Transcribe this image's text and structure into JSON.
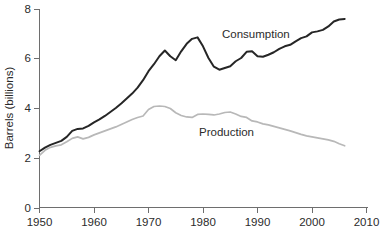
{
  "chart_data": {
    "type": "line",
    "title": "",
    "xlabel": "",
    "ylabel": "Barrels (billions)",
    "xlim": [
      1950,
      2010
    ],
    "ylim": [
      0,
      8
    ],
    "xticks": [
      1950,
      1960,
      1970,
      1980,
      1990,
      2000,
      2010
    ],
    "yticks": [
      0,
      2,
      4,
      6,
      8
    ],
    "grid": false,
    "legend_position": "inline-annotations",
    "annotations": [
      {
        "text": "Consumption",
        "x": 1983,
        "y": 7.05
      },
      {
        "text": "Production",
        "x": 1978,
        "y": 3.1
      }
    ],
    "x": [
      1950,
      1951,
      1952,
      1953,
      1954,
      1955,
      1956,
      1957,
      1958,
      1959,
      1960,
      1961,
      1962,
      1963,
      1964,
      1965,
      1966,
      1967,
      1968,
      1969,
      1970,
      1971,
      1972,
      1973,
      1974,
      1975,
      1976,
      1977,
      1978,
      1979,
      1980,
      1981,
      1982,
      1983,
      1984,
      1985,
      1986,
      1987,
      1988,
      1989,
      1990,
      1991,
      1992,
      1993,
      1994,
      1995,
      1996,
      1997,
      1998,
      1999,
      2000,
      2001,
      2002,
      2003,
      2004,
      2005,
      2006
    ],
    "series": [
      {
        "name": "Consumption",
        "color": "#262626",
        "values": [
          2.3,
          2.45,
          2.56,
          2.64,
          2.72,
          2.88,
          3.12,
          3.2,
          3.22,
          3.32,
          3.46,
          3.58,
          3.72,
          3.88,
          4.04,
          4.22,
          4.42,
          4.62,
          4.86,
          5.16,
          5.52,
          5.8,
          6.12,
          6.35,
          6.12,
          5.96,
          6.32,
          6.62,
          6.82,
          6.88,
          6.52,
          6.05,
          5.7,
          5.58,
          5.65,
          5.72,
          5.92,
          6.05,
          6.3,
          6.32,
          6.12,
          6.1,
          6.18,
          6.28,
          6.42,
          6.52,
          6.58,
          6.72,
          6.85,
          6.92,
          7.08,
          7.12,
          7.18,
          7.32,
          7.52,
          7.6,
          7.62
        ]
      },
      {
        "name": "Production",
        "color": "#b8b8b8",
        "values": [
          2.14,
          2.34,
          2.46,
          2.52,
          2.56,
          2.68,
          2.82,
          2.88,
          2.8,
          2.86,
          2.96,
          3.04,
          3.12,
          3.2,
          3.28,
          3.38,
          3.48,
          3.58,
          3.66,
          3.72,
          3.98,
          4.1,
          4.12,
          4.1,
          4.02,
          3.85,
          3.74,
          3.68,
          3.66,
          3.78,
          3.8,
          3.78,
          3.76,
          3.8,
          3.86,
          3.88,
          3.8,
          3.7,
          3.66,
          3.52,
          3.48,
          3.4,
          3.36,
          3.3,
          3.24,
          3.18,
          3.12,
          3.05,
          2.98,
          2.92,
          2.88,
          2.84,
          2.8,
          2.76,
          2.7,
          2.6,
          2.52
        ]
      }
    ]
  },
  "axes": {
    "y_title": "Barrels (billions)",
    "y_tick_labels": [
      "0",
      "2",
      "4",
      "6",
      "8"
    ],
    "x_tick_labels": [
      "1950",
      "1960",
      "1970",
      "1980",
      "1990",
      "2000",
      "2010"
    ]
  },
  "labels": {
    "consumption": "Consumption",
    "production": "Production"
  }
}
